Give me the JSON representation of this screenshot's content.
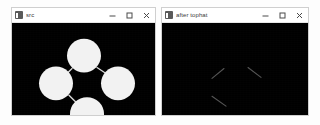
{
  "desktop": {
    "background_color": "#fdfdfd"
  },
  "windows": [
    {
      "id": "src",
      "title": "src",
      "icon": "opencv-window-icon",
      "titlebar_color": "#ffffff",
      "canvas_background": "#000000",
      "controls": {
        "minimize_label": "Minimize",
        "maximize_label": "Maximize",
        "close_label": "Close"
      },
      "image": {
        "description": "Four white filled circles arranged in a diamond, joined by thin white connecting lines on a black background",
        "shape_color": "#f2f2f2",
        "line_color": "#d8d8d8",
        "circles": [
          {
            "name": "top-circle",
            "cx": 72,
            "cy": 33,
            "r": 17
          },
          {
            "name": "left-circle",
            "cx": 44,
            "cy": 61,
            "r": 17
          },
          {
            "name": "right-circle",
            "cx": 106,
            "cy": 61,
            "r": 17
          },
          {
            "name": "bottom-circle",
            "cx": 75,
            "cy": 92,
            "r": 17
          }
        ],
        "connections": [
          {
            "name": "top-left-link",
            "x1": 60,
            "y1": 46,
            "x2": 56,
            "y2": 50
          },
          {
            "name": "top-right-link",
            "x1": 85,
            "y1": 45,
            "x2": 94,
            "y2": 51
          },
          {
            "name": "left-bottom-link",
            "x1": 57,
            "y1": 73,
            "x2": 64,
            "y2": 80
          }
        ]
      }
    },
    {
      "id": "after-tophat",
      "title": "after tophat",
      "icon": "opencv-window-icon",
      "titlebar_color": "#ffffff",
      "canvas_background": "#000000",
      "controls": {
        "minimize_label": "Minimize",
        "maximize_label": "Maximize",
        "close_label": "Close"
      },
      "image": {
        "description": "Result of a morphological top-hat transform: the solid circles are removed and only faint thin diagonal line fragments remain on black",
        "shape_color": "#000000",
        "line_color": "#9a9a9a",
        "circles": [],
        "connections": [
          {
            "name": "top-left-fragment",
            "x1": 50,
            "y1": 56,
            "x2": 62,
            "y2": 46
          },
          {
            "name": "top-right-fragment",
            "x1": 86,
            "y1": 45,
            "x2": 99,
            "y2": 55
          },
          {
            "name": "left-bottom-fragment",
            "x1": 50,
            "y1": 74,
            "x2": 64,
            "y2": 84
          }
        ]
      }
    }
  ]
}
